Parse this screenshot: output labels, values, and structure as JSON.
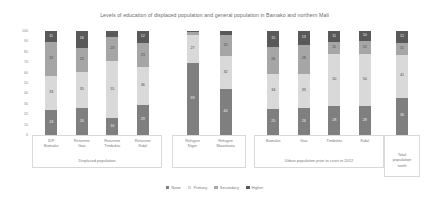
{
  "chart_data": {
    "type": "bar",
    "title": "Levels of education of displaced population and general population in Bamako and northern Mali",
    "xlabel": "",
    "ylabel": "",
    "ylim": [
      0,
      100
    ],
    "yticks": [
      "0",
      "10",
      "20",
      "30",
      "40",
      "50",
      "60",
      "70",
      "80",
      "90",
      "100"
    ],
    "grid": false,
    "stacked": true,
    "legend_position": "bottom",
    "legend": [
      "None",
      "Primary",
      "Secondary",
      "Higher"
    ],
    "series_colors": [
      "#7f7f7f",
      "#d9d9d9",
      "#a6a6a6",
      "#595959"
    ],
    "categories": [
      "IDP\nBamako",
      "Returnee\nGao",
      "Returnee\nTimbuktu",
      "Returnee\nKidal",
      "Refugee\nNiger",
      "Refugee\nMauritania",
      "Bamako",
      "Gao",
      "Timbuktu",
      "Kidal",
      "Total\npopulation\nnorth"
    ],
    "series": [
      {
        "name": "None",
        "values": [
          24,
          26,
          16,
          29,
          69,
          44,
          25,
          26,
          28,
          28,
          36
        ]
      },
      {
        "name": "Primary",
        "values": [
          33,
          35,
          55,
          36,
          27,
          32,
          34,
          33,
          50,
          50,
          41
        ]
      },
      {
        "name": "Secondary",
        "values": [
          32,
          23,
          23,
          23,
          3,
          20,
          26,
          28,
          11,
          12,
          11
        ]
      },
      {
        "name": "Higher",
        "values": [
          11,
          16,
          6,
          12,
          1,
          4,
          15,
          13,
          11,
          10,
          12
        ]
      }
    ],
    "panels": [
      {
        "label": "Displaced population",
        "categories": [
          0,
          1,
          2,
          3
        ]
      },
      {
        "label": "",
        "categories": [
          4,
          5
        ]
      },
      {
        "label": "Urban population prior to crisis in 2012",
        "categories": [
          6,
          7,
          8,
          9
        ]
      },
      {
        "label": "Total\npopulation\nnorth",
        "categories": [
          10
        ]
      }
    ]
  }
}
